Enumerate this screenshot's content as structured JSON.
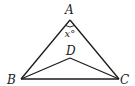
{
  "diagram": {
    "type": "geometry-triangle",
    "points": {
      "A": {
        "label": "A",
        "x": 70,
        "y": 20
      },
      "B": {
        "label": "B",
        "x": 21,
        "y": 79
      },
      "C": {
        "label": "C",
        "x": 119,
        "y": 79
      },
      "D": {
        "label": "D",
        "x": 70,
        "y": 58
      }
    },
    "segments": [
      "AB",
      "AC",
      "BC",
      "BD",
      "DC"
    ],
    "angle_label": "x°",
    "colors": {
      "line": "#1a1a1a",
      "background": "#ffffff"
    }
  }
}
